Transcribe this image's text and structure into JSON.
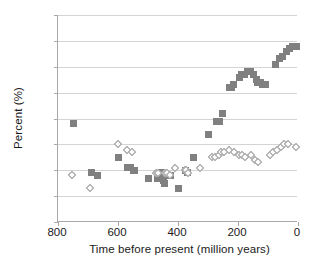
{
  "chart_data": {
    "type": "scatter",
    "title": "",
    "xlabel": "Time before present (million years)",
    "ylabel": "Percent (%)",
    "xlim": [
      800,
      0
    ],
    "ylim": [
      0,
      80
    ],
    "x_reversed": true,
    "xticks": [
      800,
      600,
      400,
      200,
      0
    ],
    "yticks": [
      0,
      10,
      20,
      30,
      40,
      50,
      60,
      70,
      80
    ],
    "grid": "horizontal",
    "legend_position": "none",
    "series": [
      {
        "name": "filled-squares",
        "marker": "square",
        "color": "#808080",
        "points": [
          [
            748,
            38
          ],
          [
            688,
            19
          ],
          [
            668,
            18
          ],
          [
            600,
            25
          ],
          [
            568,
            21
          ],
          [
            558,
            21
          ],
          [
            548,
            20
          ],
          [
            544,
            20
          ],
          [
            500,
            17
          ],
          [
            470,
            17
          ],
          [
            456,
            19
          ],
          [
            452,
            18
          ],
          [
            448,
            16
          ],
          [
            444,
            15
          ],
          [
            432,
            18
          ],
          [
            428,
            18
          ],
          [
            424,
            18
          ],
          [
            400,
            13
          ],
          [
            374,
            20
          ],
          [
            370,
            19
          ],
          [
            348,
            25
          ],
          [
            300,
            34
          ],
          [
            272,
            39
          ],
          [
            262,
            39
          ],
          [
            252,
            42
          ],
          [
            228,
            52
          ],
          [
            222,
            52
          ],
          [
            214,
            53
          ],
          [
            196,
            56
          ],
          [
            188,
            57
          ],
          [
            178,
            57
          ],
          [
            168,
            58
          ],
          [
            160,
            58
          ],
          [
            148,
            57
          ],
          [
            140,
            55
          ],
          [
            134,
            54
          ],
          [
            126,
            54
          ],
          [
            118,
            53
          ],
          [
            110,
            53
          ],
          [
            74,
            61
          ],
          [
            62,
            63
          ],
          [
            52,
            64
          ],
          [
            40,
            66
          ],
          [
            30,
            67
          ],
          [
            20,
            68
          ],
          [
            10,
            68
          ],
          [
            4,
            68
          ]
        ]
      },
      {
        "name": "open-diamonds",
        "marker": "diamond",
        "color": "#ffffff",
        "edge_color": "#9a9a9a",
        "points": [
          [
            754,
            18
          ],
          [
            692,
            13
          ],
          [
            600,
            30
          ],
          [
            570,
            28
          ],
          [
            552,
            27
          ],
          [
            474,
            19
          ],
          [
            466,
            19
          ],
          [
            442,
            19
          ],
          [
            436,
            19
          ],
          [
            428,
            18
          ],
          [
            410,
            21
          ],
          [
            378,
            20
          ],
          [
            372,
            20
          ],
          [
            366,
            19
          ],
          [
            326,
            21
          ],
          [
            286,
            25
          ],
          [
            276,
            25
          ],
          [
            264,
            26
          ],
          [
            256,
            27
          ],
          [
            246,
            27
          ],
          [
            230,
            28
          ],
          [
            212,
            27
          ],
          [
            196,
            26
          ],
          [
            186,
            26
          ],
          [
            176,
            25
          ],
          [
            156,
            26
          ],
          [
            142,
            24
          ],
          [
            132,
            23
          ],
          [
            94,
            26
          ],
          [
            82,
            27
          ],
          [
            70,
            28
          ],
          [
            58,
            29
          ],
          [
            46,
            30
          ],
          [
            34,
            30
          ],
          [
            8,
            29
          ]
        ]
      }
    ]
  }
}
